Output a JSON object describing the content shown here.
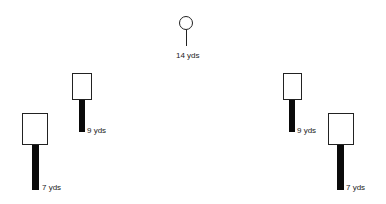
{
  "diagram": {
    "colors": {
      "background": "#ffffff",
      "stroke": "#222222",
      "bar_fill": "#0a0a0a"
    },
    "center_pin": {
      "label": "14 yds"
    },
    "stations": [
      {
        "id": "left-far",
        "label": "7 yds"
      },
      {
        "id": "left-near",
        "label": "9 yds"
      },
      {
        "id": "right-near",
        "label": "9 yds"
      },
      {
        "id": "right-far",
        "label": "7 yds"
      }
    ]
  }
}
